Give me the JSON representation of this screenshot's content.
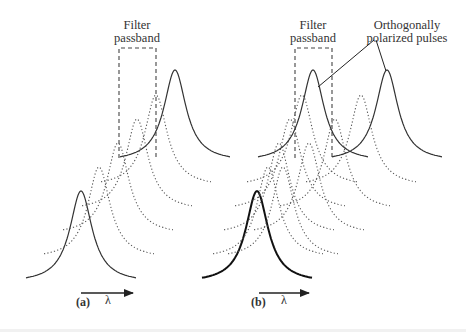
{
  "figure": {
    "type": "diagram",
    "colors": {
      "ink": "#333333",
      "dotted": "#555555",
      "dashed_box": "#444444",
      "background": "#ffffff"
    }
  },
  "panel_a": {
    "label": "(a)",
    "axis_label": "λ",
    "filter_label_line1": "Filter",
    "filter_label_line2": "passband",
    "filter_box": {
      "x": 119,
      "y": 48,
      "w": 37,
      "h": 110
    },
    "pulse_shape": {
      "height": 92,
      "halfwidth": 13.5,
      "span": 55
    },
    "pulses": [
      {
        "center": 81,
        "base": 283,
        "style": "solid"
      },
      {
        "center": 99,
        "base": 259,
        "style": "dotted"
      },
      {
        "center": 118,
        "base": 235,
        "style": "dotted"
      },
      {
        "center": 137,
        "base": 211,
        "style": "dotted"
      },
      {
        "center": 156,
        "base": 187,
        "style": "dotted"
      },
      {
        "center": 175,
        "base": 162,
        "style": "solid"
      }
    ],
    "arrow": {
      "x1": 81,
      "x2": 133,
      "y": 293
    },
    "label_pos": {
      "x": 76,
      "y": 306
    },
    "lambda_pos": {
      "x": 105,
      "y": 304
    }
  },
  "panel_b": {
    "label": "(b)",
    "axis_label": "λ",
    "filter_label_line1": "Filter",
    "filter_label_line2": "passband",
    "annotation_line1": "Orthogonally",
    "annotation_line2": "polarized pulses",
    "filter_box": {
      "x": 295,
      "y": 48,
      "w": 37,
      "h": 110
    },
    "pulse_shape": {
      "height": 92,
      "halfwidth": 13.5,
      "span": 55
    },
    "pulses": [
      {
        "center": 257,
        "base": 283,
        "style": "thick"
      },
      {
        "center": 268,
        "base": 259,
        "style": "dotted"
      },
      {
        "center": 283,
        "base": 259,
        "style": "dotted"
      },
      {
        "center": 279,
        "base": 235,
        "style": "dotted"
      },
      {
        "center": 309,
        "base": 235,
        "style": "dotted"
      },
      {
        "center": 290,
        "base": 211,
        "style": "dotted"
      },
      {
        "center": 335,
        "base": 211,
        "style": "dotted"
      },
      {
        "center": 302,
        "base": 187,
        "style": "dotted"
      },
      {
        "center": 361,
        "base": 187,
        "style": "dotted"
      },
      {
        "center": 313,
        "base": 162,
        "style": "solid"
      },
      {
        "center": 387,
        "base": 162,
        "style": "solid"
      }
    ],
    "leaders": [
      {
        "x1": 374,
        "y1": 40,
        "x2": 318,
        "y2": 87
      },
      {
        "x1": 376,
        "y1": 40,
        "x2": 386,
        "y2": 71
      }
    ],
    "arrow": {
      "x1": 259,
      "x2": 309,
      "y": 293
    },
    "label_pos": {
      "x": 251,
      "y": 306
    },
    "lambda_pos": {
      "x": 281,
      "y": 304
    }
  }
}
